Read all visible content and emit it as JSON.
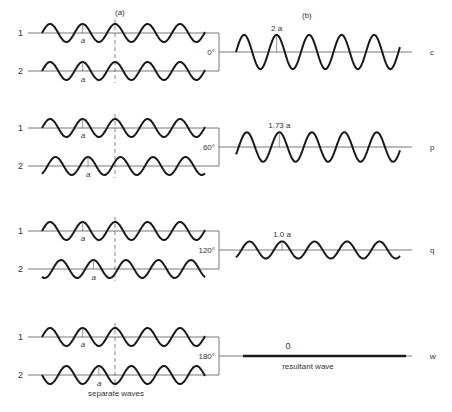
{
  "headers": {
    "left": "(a)",
    "right": "(b)"
  },
  "amplitude_label": "a",
  "left_caption": "separate waves",
  "right_caption": "resultant wave",
  "wave_labels": {
    "first": "1",
    "second": "2"
  },
  "rows": [
    {
      "phase": "0°",
      "resultant_amplitude": "2 a",
      "resultant_label": "c",
      "amp_ratio": 2.0,
      "phase_deg": 0
    },
    {
      "phase": "60°",
      "resultant_amplitude": "1.73 a",
      "resultant_label": "p",
      "amp_ratio": 1.73,
      "phase_deg": 60
    },
    {
      "phase": "120°",
      "resultant_amplitude": "1.0 a",
      "resultant_label": "q",
      "amp_ratio": 1.0,
      "phase_deg": 120
    },
    {
      "phase": "180°",
      "resultant_amplitude": "0",
      "resultant_label": "w",
      "amp_ratio": 0,
      "phase_deg": 180
    }
  ],
  "colors": {
    "stroke": "#1a1a1a",
    "thin": "#555555",
    "text": "#333333"
  }
}
